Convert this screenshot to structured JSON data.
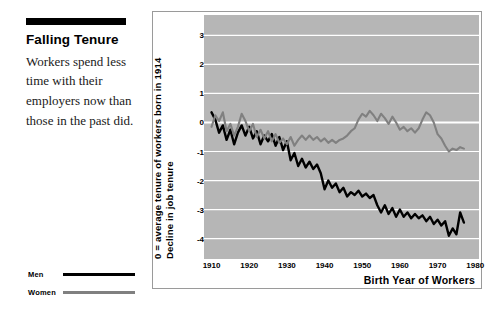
{
  "caption": {
    "title": "Falling Tenure",
    "body": "Workers spend less time with their employers now than those in the past did."
  },
  "legend": {
    "position": "bottom-left",
    "items": [
      {
        "label": "Men",
        "color": "#000000"
      },
      {
        "label": "Women",
        "color": "#808080"
      }
    ]
  },
  "chart_data": {
    "type": "line",
    "title": "",
    "subtitle": "",
    "xlabel": "Birth Year of Workers",
    "ylabel": "Decline in job tenure",
    "ylabel_line2": "0 = average tenure of workers born in 1914",
    "xlim": [
      1908,
      1981
    ],
    "ylim": [
      -4.6,
      3.6
    ],
    "xticks": [
      1910,
      1920,
      1930,
      1940,
      1950,
      1960,
      1970,
      1980
    ],
    "xtick_labels": [
      "1910",
      "1920",
      "1930",
      "1940",
      "1950",
      "1960",
      "1970",
      "1980"
    ],
    "yticks": [
      3,
      2,
      1,
      0,
      -1,
      -2,
      -3,
      -4
    ],
    "ytick_labels": [
      "3",
      "2",
      "1",
      "0",
      "-1",
      "-2",
      "-3",
      "-4"
    ],
    "grid": true,
    "grid_color": "#ffffff",
    "plot_bgcolor": "#b6b6b6",
    "legend_position": "outside-bottom-left",
    "series": [
      {
        "name": "Men",
        "color": "#000000",
        "x": [
          1910,
          1911,
          1912,
          1913,
          1914,
          1915,
          1916,
          1917,
          1918,
          1919,
          1920,
          1921,
          1922,
          1923,
          1924,
          1925,
          1926,
          1927,
          1928,
          1929,
          1930,
          1931,
          1932,
          1933,
          1934,
          1935,
          1936,
          1937,
          1938,
          1939,
          1940,
          1941,
          1942,
          1943,
          1944,
          1945,
          1946,
          1947,
          1948,
          1949,
          1950,
          1951,
          1952,
          1953,
          1954,
          1955,
          1956,
          1957,
          1958,
          1959,
          1960,
          1961,
          1962,
          1963,
          1964,
          1965,
          1966,
          1967,
          1968,
          1969,
          1970,
          1971,
          1972,
          1973,
          1974,
          1975,
          1976,
          1977
        ],
        "values": [
          0.35,
          0.1,
          -0.35,
          -0.1,
          -0.6,
          -0.25,
          -0.75,
          -0.35,
          -0.1,
          -0.45,
          -0.15,
          -0.55,
          -0.3,
          -0.75,
          -0.45,
          -0.65,
          -0.4,
          -0.8,
          -0.5,
          -0.95,
          -0.65,
          -1.3,
          -1.05,
          -1.5,
          -1.25,
          -1.55,
          -1.35,
          -1.6,
          -1.45,
          -1.75,
          -2.3,
          -2.0,
          -2.25,
          -2.1,
          -2.4,
          -2.25,
          -2.55,
          -2.4,
          -2.5,
          -2.35,
          -2.55,
          -2.45,
          -2.6,
          -2.5,
          -2.85,
          -3.1,
          -2.85,
          -3.15,
          -2.95,
          -3.25,
          -3.0,
          -3.25,
          -3.1,
          -3.3,
          -3.15,
          -3.3,
          -3.2,
          -3.4,
          -3.25,
          -3.5,
          -3.35,
          -3.55,
          -3.4,
          -3.9,
          -3.65,
          -3.85,
          -3.1,
          -3.45
        ]
      },
      {
        "name": "Women",
        "color": "#808080",
        "x": [
          1910,
          1911,
          1912,
          1913,
          1914,
          1915,
          1916,
          1917,
          1918,
          1919,
          1920,
          1921,
          1922,
          1923,
          1924,
          1925,
          1926,
          1927,
          1928,
          1929,
          1930,
          1931,
          1932,
          1933,
          1934,
          1935,
          1936,
          1937,
          1938,
          1939,
          1940,
          1941,
          1942,
          1943,
          1944,
          1945,
          1946,
          1947,
          1948,
          1949,
          1950,
          1951,
          1952,
          1953,
          1954,
          1955,
          1956,
          1957,
          1958,
          1959,
          1960,
          1961,
          1962,
          1963,
          1964,
          1965,
          1966,
          1967,
          1968,
          1969,
          1970,
          1971,
          1972,
          1973,
          1974,
          1975,
          1976,
          1977
        ],
        "values": [
          -0.15,
          0.25,
          0.05,
          0.35,
          -0.3,
          -0.05,
          -0.45,
          -0.15,
          0.3,
          0.05,
          -0.3,
          -0.05,
          -0.5,
          -0.25,
          -0.55,
          -0.3,
          -0.65,
          -0.4,
          -0.7,
          -0.55,
          -0.75,
          -0.5,
          -0.8,
          -0.6,
          -0.45,
          -0.6,
          -0.45,
          -0.6,
          -0.5,
          -0.65,
          -0.55,
          -0.7,
          -0.6,
          -0.7,
          -0.6,
          -0.55,
          -0.45,
          -0.3,
          -0.2,
          0.1,
          0.3,
          0.2,
          0.4,
          0.25,
          0.05,
          0.3,
          0.15,
          -0.05,
          0.2,
          0.0,
          -0.25,
          -0.15,
          -0.3,
          -0.2,
          -0.35,
          -0.2,
          0.1,
          0.35,
          0.25,
          0.0,
          -0.4,
          -0.55,
          -0.8,
          -1.0,
          -0.9,
          -0.95,
          -0.85,
          -0.9
        ]
      }
    ]
  }
}
